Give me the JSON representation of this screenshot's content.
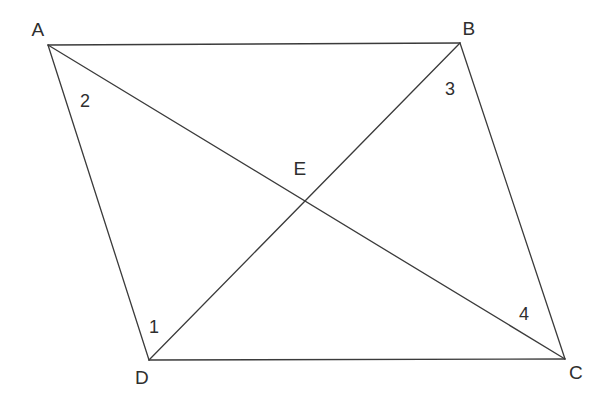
{
  "figure": {
    "type": "geometry-diagram",
    "canvas": {
      "width": 606,
      "height": 396,
      "background": "#ffffff"
    },
    "stroke": {
      "color": "#3b3b3b",
      "width": 1.3
    },
    "text_color": "#2e2e2e",
    "points": {
      "A": {
        "label": "A",
        "x": 48,
        "y": 45,
        "label_x": 38,
        "label_y": 29
      },
      "B": {
        "label": "B",
        "x": 460,
        "y": 43,
        "label_x": 469,
        "label_y": 28
      },
      "C": {
        "label": "C",
        "x": 565,
        "y": 359,
        "label_x": 576,
        "label_y": 372
      },
      "D": {
        "label": "D",
        "x": 149,
        "y": 360,
        "label_x": 142,
        "label_y": 377
      },
      "E": {
        "label": "E",
        "x": 303,
        "y": 200,
        "label_x": 300,
        "label_y": 168
      }
    },
    "segments": [
      {
        "name": "side-AB",
        "from": "A",
        "to": "B"
      },
      {
        "name": "side-BC",
        "from": "B",
        "to": "C"
      },
      {
        "name": "side-CD",
        "from": "C",
        "to": "D"
      },
      {
        "name": "side-DA",
        "from": "D",
        "to": "A"
      },
      {
        "name": "diagonal-AC",
        "from": "A",
        "to": "C"
      },
      {
        "name": "diagonal-DB",
        "from": "D",
        "to": "B"
      }
    ],
    "angle_labels": [
      {
        "name": "angle-1",
        "text": "1",
        "x": 154,
        "y": 327,
        "at_vertex": "D"
      },
      {
        "name": "angle-2",
        "text": "2",
        "x": 85,
        "y": 101,
        "at_vertex": "A"
      },
      {
        "name": "angle-3",
        "text": "3",
        "x": 450,
        "y": 89,
        "at_vertex": "B"
      },
      {
        "name": "angle-4",
        "text": "4",
        "x": 524,
        "y": 314,
        "at_vertex": "C"
      }
    ]
  }
}
